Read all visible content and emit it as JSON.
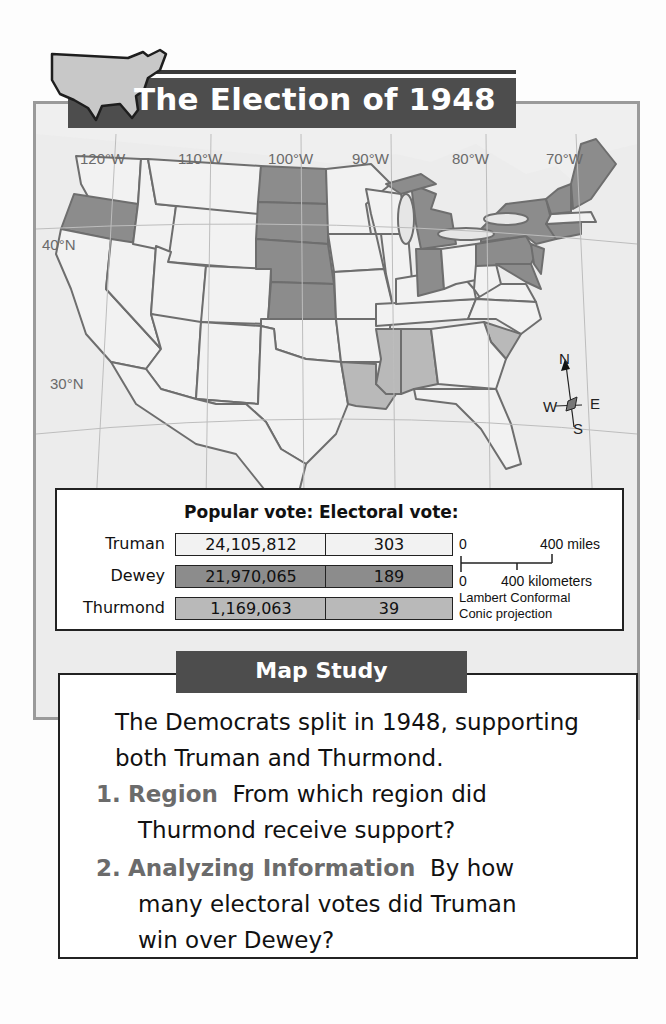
{
  "title": "The Election of 1948",
  "map": {
    "longitude_labels": [
      "120°W",
      "110°W",
      "100°W",
      "90°W",
      "80°W",
      "70°W"
    ],
    "latitude_labels": [
      "40°N",
      "30°N"
    ],
    "compass": {
      "n": "N",
      "s": "S",
      "e": "E",
      "w": "W"
    },
    "colors": {
      "truman": "#f2f2f2",
      "dewey": "#8c8c8c",
      "thurmond": "#b9b9b9",
      "water": "#ececec",
      "border": "#6e6e6e"
    },
    "states_dewey": [
      "Oregon",
      "North Dakota",
      "South Dakota",
      "Nebraska",
      "Kansas",
      "Michigan",
      "Indiana",
      "New York",
      "Pennsylvania",
      "New Jersey",
      "Delaware",
      "Maryland",
      "Connecticut",
      "Vermont",
      "New Hampshire",
      "Maine"
    ],
    "states_thurmond": [
      "Louisiana",
      "Mississippi",
      "Alabama",
      "South Carolina"
    ]
  },
  "legend": {
    "header_popular": "Popular vote:",
    "header_electoral": "Electoral vote:",
    "rows": [
      {
        "candidate": "Truman",
        "popular": "24,105,812",
        "electoral": "303",
        "fill": "#f2f2f2"
      },
      {
        "candidate": "Dewey",
        "popular": "21,970,065",
        "electoral": "189",
        "fill": "#8c8c8c"
      },
      {
        "candidate": "Thurmond",
        "popular": "1,169,063",
        "electoral": "39",
        "fill": "#b9b9b9"
      }
    ],
    "scale": {
      "miles_zero": "0",
      "miles_label": "400 miles",
      "km_zero": "0",
      "km_label": "400 kilometers",
      "projection_line1": "Lambert Conformal",
      "projection_line2": "Conic projection"
    }
  },
  "map_study": {
    "heading": "Map Study",
    "intro": "The Democrats split in 1948, supporting both Truman and Thurmond.",
    "questions": [
      {
        "number": "1.",
        "keyword": "Region",
        "text": "From which region did",
        "text2": "Thurmond receive support?"
      },
      {
        "number": "2.",
        "keyword": "Analyzing Information",
        "text": "By how",
        "text2": "many electoral votes did Truman",
        "text3": "win over Dewey?"
      }
    ]
  }
}
